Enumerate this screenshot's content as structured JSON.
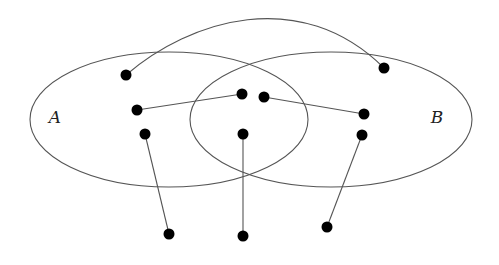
{
  "diagram": {
    "type": "venn-with-mapping",
    "colors": {
      "stroke": "#555555",
      "dot": "#000000",
      "label": "#222222",
      "background": "#ffffff"
    },
    "sets": [
      {
        "id": "A",
        "label": "A",
        "cx": 169,
        "cy": 119.5,
        "rx": 139,
        "ry": 67.5,
        "label_x": 55,
        "label_y": 118
      },
      {
        "id": "B",
        "label": "B",
        "cx": 331,
        "cy": 119.5,
        "rx": 141,
        "ry": 67.5,
        "label_x": 437,
        "label_y": 118
      }
    ],
    "nodes": [
      {
        "id": "a1",
        "x": 126,
        "y": 75
      },
      {
        "id": "a2",
        "x": 137,
        "y": 110
      },
      {
        "id": "a3",
        "x": 145,
        "y": 134
      },
      {
        "id": "ab1",
        "x": 242,
        "y": 94
      },
      {
        "id": "ab2",
        "x": 264,
        "y": 97
      },
      {
        "id": "ab3",
        "x": 243,
        "y": 134
      },
      {
        "id": "b1",
        "x": 384,
        "y": 68
      },
      {
        "id": "b2",
        "x": 364,
        "y": 114
      },
      {
        "id": "b3",
        "x": 362,
        "y": 135
      },
      {
        "id": "o1",
        "x": 169,
        "y": 234
      },
      {
        "id": "o2",
        "x": 243,
        "y": 236
      },
      {
        "id": "o3",
        "x": 327,
        "y": 227
      }
    ],
    "edges": [
      {
        "from": "a1",
        "to": "b1",
        "curve": "M126,75 C190,20 300,-15 384,68"
      },
      {
        "from": "a2",
        "to": "ab1"
      },
      {
        "from": "ab2",
        "to": "b2"
      },
      {
        "from": "a3",
        "to": "o1"
      },
      {
        "from": "ab3",
        "to": "o2"
      },
      {
        "from": "b3",
        "to": "o3"
      }
    ]
  }
}
